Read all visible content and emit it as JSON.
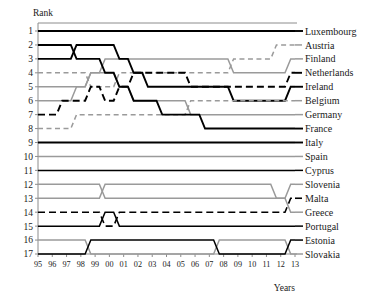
{
  "chart_data": {
    "type": "line",
    "subtype": "bump-chart",
    "title": "",
    "xlabel": "Years",
    "ylabel": "Rank",
    "grid": false,
    "legend": "right-series-labels",
    "x": [
      "95",
      "96",
      "97",
      "98",
      "99",
      "00",
      "01",
      "02",
      "03",
      "04",
      "05",
      "06",
      "07",
      "08",
      "09",
      "10",
      "11",
      "12",
      "13"
    ],
    "x_tick_labels": [
      "95",
      "96",
      "97",
      "98",
      "99",
      "00",
      "01",
      "02",
      "03",
      "04",
      "05",
      "06",
      "07",
      "08",
      "09",
      "10",
      "11",
      "12",
      "13"
    ],
    "y_tick_labels": [
      "1",
      "2",
      "3",
      "4",
      "5",
      "6",
      "7",
      "8",
      "9",
      "10",
      "11",
      "12",
      "13",
      "14",
      "15",
      "16",
      "17"
    ],
    "ylim": [
      1,
      17
    ],
    "y_inverted": true,
    "colors": {
      "black": "#000000",
      "gray": "#9a9a9a",
      "axis": "#8c8c8c"
    },
    "series": [
      {
        "name": "Luxembourg",
        "color": "#000000",
        "style": "solid",
        "width": 1.9,
        "values": [
          1,
          1,
          1,
          1,
          1,
          1,
          1,
          1,
          1,
          1,
          1,
          1,
          1,
          1,
          1,
          1,
          1,
          1,
          1
        ]
      },
      {
        "name": "Austria",
        "color": "#9a9a9a",
        "style": "dashed",
        "width": 1.5,
        "values": [
          4,
          4,
          4,
          4,
          5,
          5,
          4,
          4,
          4,
          4,
          4,
          4,
          4,
          4,
          3,
          3,
          3,
          2,
          2
        ]
      },
      {
        "name": "Finland",
        "color": "#9a9a9a",
        "style": "solid",
        "width": 1.5,
        "values": [
          6,
          6,
          6,
          5,
          4,
          3,
          3,
          3,
          3,
          3,
          3,
          3,
          3,
          3,
          4,
          4,
          4,
          4,
          3
        ]
      },
      {
        "name": "Netherlands",
        "color": "#000000",
        "style": "dashed",
        "width": 1.9,
        "values": [
          7,
          7,
          6,
          6,
          5,
          6,
          5,
          4,
          4,
          4,
          4,
          5,
          5,
          5,
          5,
          5,
          5,
          5,
          4
        ]
      },
      {
        "name": "Ireland",
        "color": "#000000",
        "style": "solid",
        "width": 1.9,
        "values": [
          3,
          3,
          3,
          2,
          2,
          2,
          3,
          4,
          5,
          5,
          5,
          5,
          5,
          5,
          6,
          6,
          6,
          6,
          5
        ]
      },
      {
        "name": "Belgium",
        "color": "#9a9a9a",
        "style": "dashed",
        "width": 1.5,
        "values": [
          8,
          8,
          8,
          7,
          7,
          7,
          7,
          7,
          7,
          7,
          7,
          6,
          6,
          6,
          6,
          6,
          6,
          6,
          6
        ]
      },
      {
        "name": "Germany",
        "color": "#9a9a9a",
        "style": "solid",
        "width": 1.5,
        "values": [
          5,
          5,
          5,
          5,
          4,
          4,
          5,
          6,
          6,
          6,
          6,
          7,
          7,
          7,
          7,
          7,
          7,
          7,
          7
        ]
      },
      {
        "name": "France",
        "color": "#000000",
        "style": "solid",
        "width": 1.9,
        "values": [
          2,
          2,
          2,
          3,
          3,
          4,
          5,
          6,
          6,
          7,
          7,
          7,
          8,
          8,
          8,
          8,
          8,
          8,
          8
        ]
      },
      {
        "name": "Italy",
        "color": "#000000",
        "style": "solid",
        "width": 1.9,
        "values": [
          9,
          9,
          9,
          9,
          9,
          9,
          9,
          9,
          9,
          9,
          9,
          9,
          9,
          9,
          9,
          9,
          9,
          9,
          9
        ]
      },
      {
        "name": "Spain",
        "color": "#9a9a9a",
        "style": "solid",
        "width": 1.5,
        "values": [
          10,
          10,
          10,
          10,
          10,
          10,
          10,
          10,
          10,
          10,
          10,
          10,
          10,
          10,
          10,
          10,
          10,
          10,
          10
        ]
      },
      {
        "name": "Cyprus",
        "color": "#000000",
        "style": "solid",
        "width": 1.5,
        "values": [
          11,
          11,
          11,
          11,
          11,
          11,
          11,
          11,
          11,
          11,
          11,
          11,
          11,
          11,
          11,
          11,
          11,
          11,
          11
        ]
      },
      {
        "name": "Slovenia",
        "color": "#9a9a9a",
        "style": "solid",
        "width": 1.5,
        "values": [
          12,
          12,
          12,
          12,
          12,
          13,
          13,
          13,
          13,
          13,
          13,
          13,
          13,
          13,
          13,
          13,
          13,
          13,
          12
        ]
      },
      {
        "name": "Malta",
        "color": "#000000",
        "style": "dashed",
        "width": 1.6,
        "values": [
          14,
          14,
          14,
          14,
          14,
          15,
          14,
          14,
          14,
          14,
          14,
          14,
          14,
          14,
          14,
          14,
          14,
          14,
          13
        ]
      },
      {
        "name": "Greece",
        "color": "#9a9a9a",
        "style": "solid",
        "width": 1.5,
        "values": [
          13,
          13,
          13,
          13,
          13,
          12,
          12,
          12,
          12,
          12,
          12,
          12,
          12,
          12,
          12,
          12,
          12,
          13,
          14
        ]
      },
      {
        "name": "Portugal",
        "color": "#000000",
        "style": "solid",
        "width": 1.5,
        "values": [
          15,
          15,
          15,
          15,
          15,
          14,
          15,
          15,
          15,
          15,
          15,
          15,
          15,
          15,
          15,
          15,
          15,
          15,
          15
        ]
      },
      {
        "name": "Estonia",
        "color": "#9a9a9a",
        "style": "solid",
        "width": 1.5,
        "values": [
          16,
          16,
          16,
          16,
          17,
          17,
          17,
          17,
          17,
          17,
          17,
          17,
          17,
          16,
          16,
          16,
          16,
          16,
          17
        ]
      },
      {
        "name": "Slovakia",
        "color": "#000000",
        "style": "solid",
        "width": 1.5,
        "values": [
          17,
          17,
          17,
          17,
          16,
          16,
          16,
          16,
          16,
          16,
          16,
          16,
          16,
          17,
          17,
          17,
          17,
          17,
          16
        ]
      }
    ],
    "series_labels_order": [
      "Luxembourg",
      "Austria",
      "Finland",
      "Netherlands",
      "Ireland",
      "Belgium",
      "Germany",
      "France",
      "Italy",
      "Spain",
      "Cyprus",
      "Slovenia",
      "Malta",
      "Greece",
      "Portugal",
      "Estonia",
      "Slovakia"
    ]
  },
  "axis": {
    "y_title": "Rank",
    "x_title": "Years"
  }
}
